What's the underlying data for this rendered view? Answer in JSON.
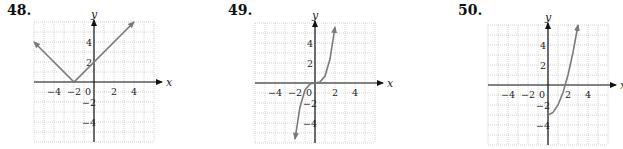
{
  "chart_data": [
    {
      "type": "line",
      "problem": "48.",
      "title": "",
      "xlabel": "x",
      "ylabel": "y",
      "xlim": [
        -6,
        6
      ],
      "ylim": [
        -6,
        6
      ],
      "grid": true,
      "x_ticks": [
        "-4",
        "-2",
        "0",
        "2",
        "4"
      ],
      "y_ticks": [
        "4",
        "2",
        "-2",
        "-4"
      ],
      "function": "y = |x + 2|",
      "series": [
        {
          "name": "curve",
          "x": [
            -6,
            -2,
            4
          ],
          "y": [
            4,
            0,
            6
          ]
        }
      ],
      "arrows": "both ends"
    },
    {
      "type": "line",
      "problem": "49.",
      "title": "",
      "xlabel": "x",
      "ylabel": "y",
      "xlim": [
        -6,
        6
      ],
      "ylim": [
        -6,
        6
      ],
      "grid": true,
      "x_ticks": [
        "-4",
        "-2",
        "0",
        "2",
        "4"
      ],
      "y_ticks": [
        "4",
        "2",
        "-2",
        "-4"
      ],
      "function": "y ≈ 0.7x³",
      "series": [
        {
          "name": "curve",
          "x": [
            -2,
            -1.5,
            -1,
            -0.5,
            0,
            0.5,
            1,
            1.5,
            2
          ],
          "y": [
            -5.6,
            -2.4,
            -0.7,
            -0.1,
            0,
            0.1,
            0.7,
            2.4,
            5.6
          ]
        }
      ],
      "arrows": "both ends"
    },
    {
      "type": "line",
      "problem": "50.",
      "title": "",
      "xlabel": "x",
      "ylabel": "y",
      "xlim": [
        -6,
        6
      ],
      "ylim": [
        -6,
        6
      ],
      "grid": true,
      "x_ticks": [
        "-4",
        "-2",
        "0",
        "2",
        "4"
      ],
      "y_ticks": [
        "4",
        "2",
        "-2",
        "-4"
      ],
      "function": "y = x² − 3, x ≥ 0",
      "series": [
        {
          "name": "curve",
          "x": [
            0,
            0.5,
            1,
            1.5,
            2,
            2.5,
            3
          ],
          "y": [
            -3,
            -2.75,
            -2,
            -0.75,
            1,
            3.25,
            6
          ]
        }
      ],
      "arrows": "right end"
    }
  ],
  "panels": [
    {
      "label": "48.",
      "left": 0,
      "numLeft": 7,
      "gx0": 33,
      "gy0": 22,
      "unit": 10,
      "ox": 94,
      "oy": 82
    },
    {
      "label": "49.",
      "left": 0,
      "numLeft": 228,
      "gx0": 255,
      "gy0": 23,
      "unit": 10,
      "ox": 315,
      "oy": 83
    },
    {
      "label": "50.",
      "left": 0,
      "numLeft": 458,
      "gx0": 488,
      "gy0": 25,
      "unit": 10,
      "ox": 548,
      "oy": 85
    }
  ]
}
